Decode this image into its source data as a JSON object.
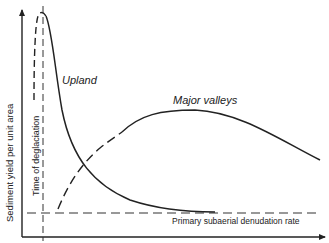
{
  "diagram": {
    "y_axis_label": "Sediment yield per unit area",
    "x_axis_label": "",
    "vertical_marker_label": "Time of deglaciation",
    "baseline_label": "Primary subaerial denudation rate",
    "curves": [
      {
        "name": "Upland",
        "description": "Sharp peak shortly after deglaciation then exponential decay toward the primary denudation rate"
      },
      {
        "name": "Major valleys",
        "description": "Gradual rise (dashed) to broad maximum then slow decline"
      }
    ],
    "colors": {
      "line": "#222222",
      "background": "#ffffff"
    }
  }
}
